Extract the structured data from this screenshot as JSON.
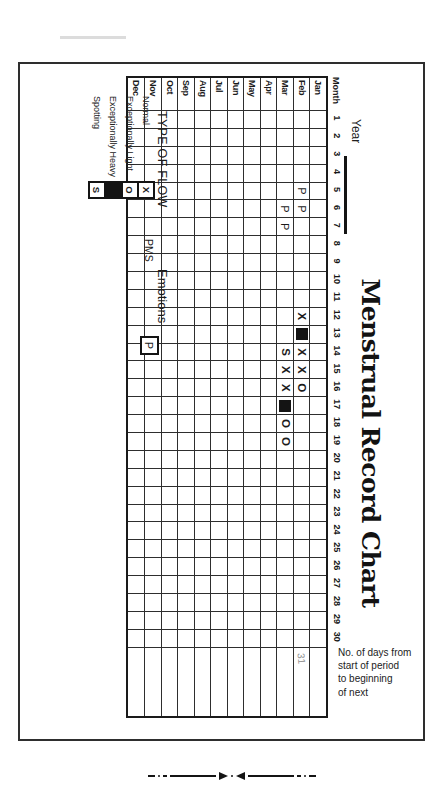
{
  "page": {
    "caption_lines": [
      "No. of days from",
      "start of period",
      "to beginning",
      "of next"
    ]
  },
  "chart": {
    "title": "Menstrual Record Chart",
    "year_label": "Year",
    "month_header": "Month",
    "days": [
      "1",
      "2",
      "3",
      "4",
      "5",
      "6",
      "7",
      "8",
      "9",
      "10",
      "11",
      "12",
      "13",
      "14",
      "15",
      "16",
      "17",
      "18",
      "19",
      "20",
      "21",
      "22",
      "23",
      "24",
      "25",
      "26",
      "27",
      "28",
      "29",
      "30"
    ],
    "months": [
      "Jan",
      "Feb",
      "Mar",
      "Apr",
      "May",
      "Jun",
      "Jul",
      "Aug",
      "Sep",
      "Oct",
      "Nov",
      "Dec"
    ],
    "marks": [
      {
        "month": "Feb",
        "day": 5,
        "symbol": "P"
      },
      {
        "month": "Feb",
        "day": 6,
        "symbol": "P"
      },
      {
        "month": "Mar",
        "day": 6,
        "symbol": "P"
      },
      {
        "month": "Mar",
        "day": 7,
        "symbol": "P"
      },
      {
        "month": "Feb",
        "day": 12,
        "symbol": "X"
      },
      {
        "month": "Feb",
        "day": 13,
        "symbol": "HEAVY"
      },
      {
        "month": "Feb",
        "day": 14,
        "symbol": "X"
      },
      {
        "month": "Feb",
        "day": 15,
        "symbol": "X"
      },
      {
        "month": "Feb",
        "day": 16,
        "symbol": "O"
      },
      {
        "month": "Mar",
        "day": 14,
        "symbol": "S"
      },
      {
        "month": "Mar",
        "day": 15,
        "symbol": "X"
      },
      {
        "month": "Mar",
        "day": 16,
        "symbol": "X"
      },
      {
        "month": "Mar",
        "day": 17,
        "symbol": "HEAVY"
      },
      {
        "month": "Mar",
        "day": 18,
        "symbol": "O"
      },
      {
        "month": "Mar",
        "day": 19,
        "symbol": "O"
      }
    ],
    "days_count_note": {
      "month": "Feb",
      "value": "31"
    }
  },
  "legend": {
    "flow_heading": "TYPE OF FLOW",
    "entries": [
      {
        "label": "Normal",
        "symbol": "X"
      },
      {
        "label": "Exceptionally Light",
        "symbol": "O"
      },
      {
        "label": "Exceptionally Heavy",
        "symbol": "HEAVY"
      },
      {
        "label": "Spotting",
        "symbol": "S"
      }
    ],
    "pms_label": "PMS",
    "emotions_label": "Emotions",
    "pms_symbol": "P"
  },
  "colors": {
    "ink": "#1b1b1b",
    "paper": "#ffffff",
    "faint_note": "#949494"
  }
}
